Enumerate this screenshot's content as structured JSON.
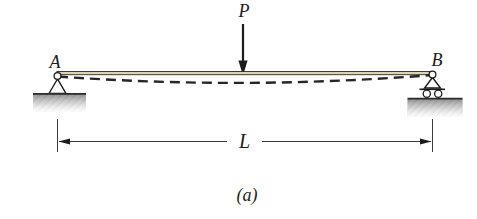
{
  "figure": {
    "caption": "(a)",
    "load_label": "P",
    "left_support_label": "A",
    "right_support_label": "B",
    "span_label": "L",
    "colors": {
      "ink": "#1c1c1c",
      "beam_fill": "#dfd2ad",
      "ground_dark": "#8f8f8f",
      "ground_light": "#ececec",
      "background": "#ffffff"
    }
  }
}
